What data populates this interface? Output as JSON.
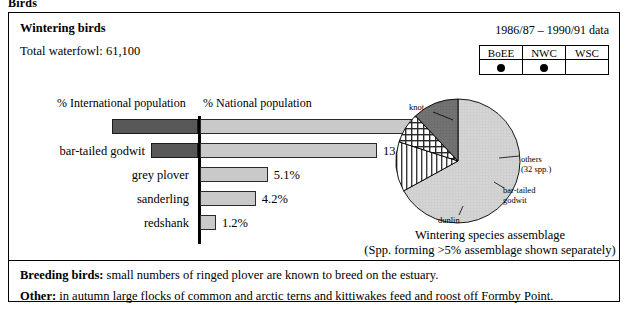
{
  "page_heading": "Birds",
  "panel": {
    "title": "Wintering birds",
    "total_line": "Total waterfowl: 61,100",
    "data_years": "1986/87 – 1990/91 data"
  },
  "survey_table": {
    "headers": [
      "BoEE",
      "NWC",
      "WSC"
    ],
    "marks": [
      "●",
      "●",
      ""
    ],
    "mark_icon": "filled-circle-icon"
  },
  "chart_data": [
    {
      "type": "bar",
      "title": "",
      "orientation": "horizontal-diverging",
      "left_header": "% International population",
      "right_header": "% National population",
      "categories": [
        "knot",
        "bar-tailed godwit",
        "grey plover",
        "sanderling",
        "redshank"
      ],
      "series": [
        {
          "name": "% International population",
          "values": [
            12.9,
            7,
            0,
            0,
            0
          ],
          "labels": [
            "12.9%",
            "7%",
            "",
            "",
            ""
          ],
          "color": "#585858"
        },
        {
          "name": "% National population",
          "values": [
            18.8,
            13.3,
            5.1,
            4.2,
            1.2
          ],
          "labels": [
            "18.8%",
            "13.3%",
            "5.1%",
            "4.2%",
            "1.2%"
          ],
          "color": "#c9c9c9"
        }
      ],
      "xlabel": "",
      "ylabel": "",
      "grid": false,
      "legend": "none"
    },
    {
      "type": "pie",
      "title": "Wintering species assemblage",
      "subtitle": "(Spp. forming >5% assemblage shown separately)",
      "labels": [
        "knot",
        "others",
        "bar-tailed godwit",
        "dunlin"
      ],
      "label_notes": [
        "",
        "(32 spp.)",
        "",
        ""
      ],
      "values": [
        67,
        13,
        8,
        12
      ],
      "unit": "% of assemblage",
      "legend": "labels-around-pie"
    }
  ],
  "footer": {
    "breeding_label": "Breeding birds:",
    "breeding_text": " small numbers of ringed plover are known to breed on the estuary.",
    "other_label": "Other:",
    "other_text": " in autumn large flocks of common and arctic terns and kittiwakes feed and roost off Formby Point."
  }
}
